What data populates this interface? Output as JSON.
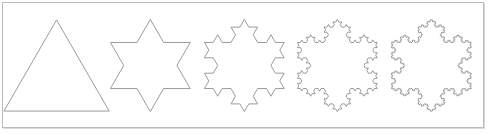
{
  "figure": {
    "background_color": "#ffffff",
    "border_color": "#b9bcbe",
    "stroke_color": "#8c9093",
    "stroke_width": 0.9,
    "panel": {
      "x": 2,
      "y": 2,
      "width": 482,
      "height": 126
    }
  },
  "chart_data": {
    "type": "diagram",
    "title": "",
    "subtitle": "",
    "xlabel": "",
    "ylabel": "",
    "grid": false,
    "legend_position": "none",
    "shape_family": "koch-snowflake",
    "initiator": "equilateral-triangle",
    "generator_rule": "replace each segment with four segments of one third length, the middle two forming an outward equilateral bump",
    "shapes": [
      {
        "index": 0,
        "label": "",
        "iteration": 0,
        "name": "equilateral triangle",
        "segments": 3,
        "vertices": 3,
        "size": 82,
        "center_x": 57,
        "center_y": 65,
        "rotation_deg": 0,
        "closed": true
      },
      {
        "index": 1,
        "label": "",
        "iteration": 1,
        "name": "six-pointed star",
        "segments": 12,
        "vertices": 12,
        "size": 85,
        "center_x": 147,
        "center_y": 65,
        "rotation_deg": 0,
        "closed": true
      },
      {
        "index": 2,
        "label": "",
        "iteration": 2,
        "name": "koch snowflake iteration two",
        "segments": 48,
        "vertices": 48,
        "size": 85,
        "center_x": 239,
        "center_y": 65,
        "rotation_deg": 0,
        "closed": true
      },
      {
        "index": 3,
        "label": "",
        "iteration": 3,
        "name": "koch snowflake iteration three",
        "segments": 192,
        "vertices": 192,
        "size": 85,
        "center_x": 331,
        "center_y": 65,
        "rotation_deg": 0,
        "closed": true
      },
      {
        "index": 4,
        "label": "",
        "iteration": 4,
        "name": "koch snowflake iteration four",
        "segments": 768,
        "vertices": 768,
        "size": 85,
        "center_x": 424,
        "center_y": 65,
        "rotation_deg": 0,
        "closed": true
      }
    ]
  }
}
